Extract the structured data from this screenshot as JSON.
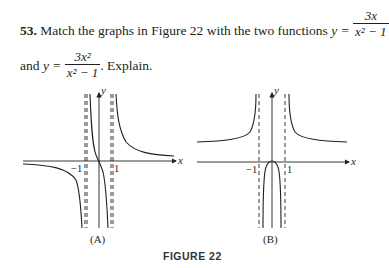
{
  "problem": {
    "number": "53.",
    "text_before": "Match the graphs in Figure 22 with the two functions ",
    "y_eq": "y =",
    "f1_num": "3x",
    "f1_den": "x² − 1",
    "connector": "and",
    "f2_num": "3x²",
    "f2_den": "x² − 1",
    "text_after": ". Explain."
  },
  "figure": {
    "caption": "FIGURE 22",
    "graphs": [
      {
        "label": "(A)",
        "x_axis": "x",
        "y_axis": "y",
        "tick_neg": "−1",
        "tick_pos": "1",
        "shape": "odd function 3x/(x²−1), passes through origin, asymptotes x=±1, y=0"
      },
      {
        "label": "(B)",
        "x_axis": "x",
        "y_axis": "y",
        "tick_neg": "−1",
        "tick_pos": "1",
        "shape": "even function 3x²/(x²−1), touches origin, asymptotes x=±1, y=3"
      }
    ]
  }
}
